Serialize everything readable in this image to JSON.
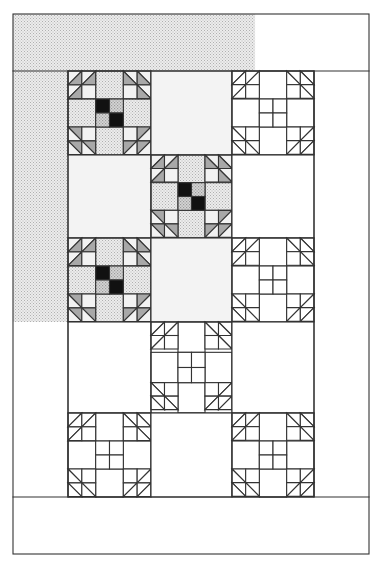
{
  "diagram": {
    "grid": {
      "columns": 3,
      "rows": 5
    },
    "colors": {
      "line": "#333333",
      "background": "#ffffff",
      "dotted_light": "#e8e8e8",
      "dotted_dot": "#b8b8b8",
      "plain_light": "#f3f3f3",
      "triangle_gray": "#a8a8a8",
      "dark": "#111111",
      "checker_dotted": "#c8c8c8"
    },
    "header_border": {
      "shaded_fraction": 0.68,
      "fill": "dotted"
    },
    "left_border": {
      "shaded_rows": 3,
      "fill": "dotted"
    },
    "footer_border": {
      "fill": "none"
    },
    "blocks": [
      {
        "row": 0,
        "col": 0,
        "type": "shoofly",
        "colored": true
      },
      {
        "row": 0,
        "col": 1,
        "type": "plain",
        "colored": true
      },
      {
        "row": 0,
        "col": 2,
        "type": "shoofly",
        "colored": false
      },
      {
        "row": 1,
        "col": 0,
        "type": "plain",
        "colored": true
      },
      {
        "row": 1,
        "col": 1,
        "type": "shoofly",
        "colored": true
      },
      {
        "row": 1,
        "col": 2,
        "type": "plain",
        "colored": false
      },
      {
        "row": 2,
        "col": 0,
        "type": "shoofly",
        "colored": true
      },
      {
        "row": 2,
        "col": 1,
        "type": "plain",
        "colored": true
      },
      {
        "row": 2,
        "col": 2,
        "type": "shoofly",
        "colored": false
      },
      {
        "row": 3,
        "col": 0,
        "type": "plain",
        "colored": false
      },
      {
        "row": 3,
        "col": 1,
        "type": "shoofly",
        "colored": false
      },
      {
        "row": 3,
        "col": 2,
        "type": "plain",
        "colored": false
      },
      {
        "row": 4,
        "col": 0,
        "type": "shoofly",
        "colored": false
      },
      {
        "row": 4,
        "col": 1,
        "type": "plain",
        "colored": false
      },
      {
        "row": 4,
        "col": 2,
        "type": "shoofly",
        "colored": false
      }
    ]
  }
}
